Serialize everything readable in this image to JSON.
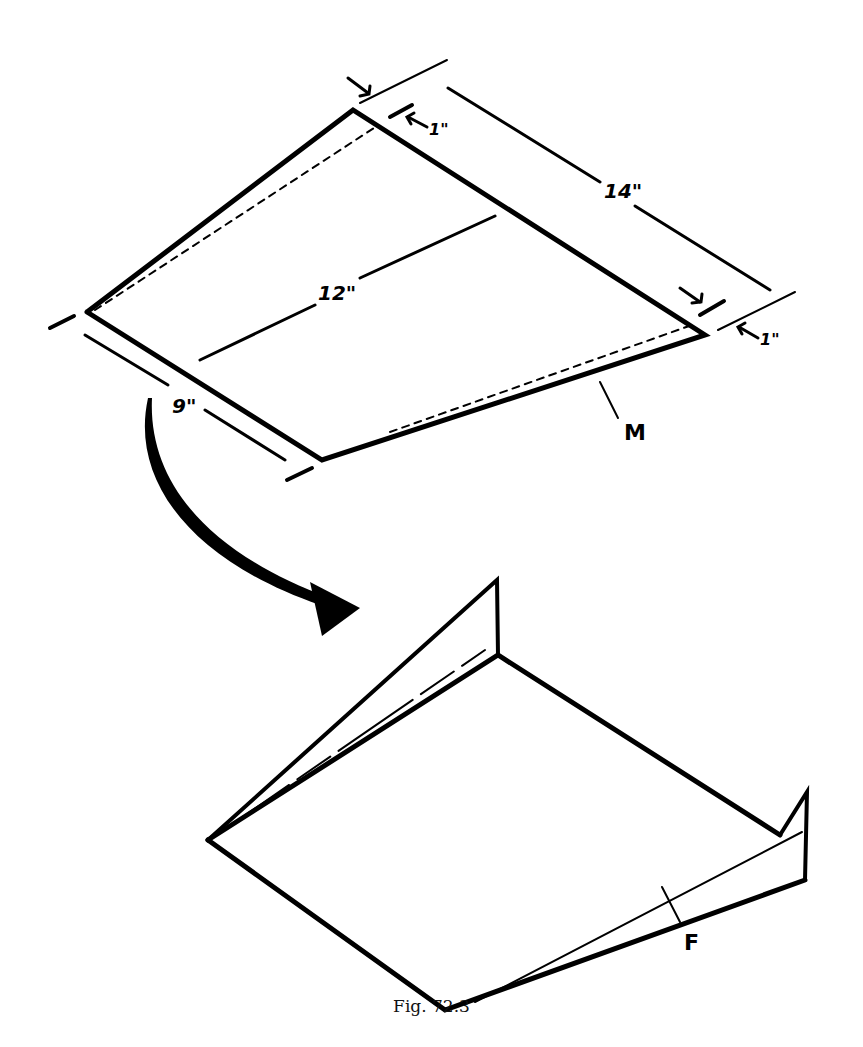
{
  "figure": {
    "caption": "Fig. 72.3",
    "top_diagram": {
      "description": "Flat sheet with dimensions before folding",
      "dimensions": {
        "top_edge": "14\"",
        "diagonal": "12\"",
        "left_edge": "9\"",
        "top_margin": "1\"",
        "right_margin": "1\""
      },
      "label_fold_line": "M"
    },
    "bottom_diagram": {
      "description": "Sheet after folding with raised edges",
      "label_fold": "F"
    },
    "colors": {
      "ink": "#000000",
      "background": "#ffffff"
    }
  }
}
